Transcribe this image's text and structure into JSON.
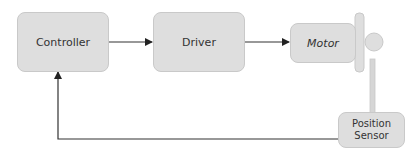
{
  "diagram": {
    "nodes": {
      "controller": {
        "label": "Controller"
      },
      "driver": {
        "label": "Driver"
      },
      "motor": {
        "label": "Motor"
      },
      "sensor": {
        "label": "Position Sensor",
        "line1": "Position",
        "line2": "Sensor"
      }
    },
    "edges": [
      {
        "from": "Controller",
        "to": "Driver"
      },
      {
        "from": "Driver",
        "to": "Motor"
      },
      {
        "from": "Motor",
        "to": "Position Sensor",
        "style": "shaft rod"
      },
      {
        "from": "Position Sensor",
        "to": "Controller",
        "style": "feedback"
      }
    ],
    "colors": {
      "box_fill": "#dedede",
      "box_border": "#c9c9c9",
      "line": "#333333"
    }
  }
}
